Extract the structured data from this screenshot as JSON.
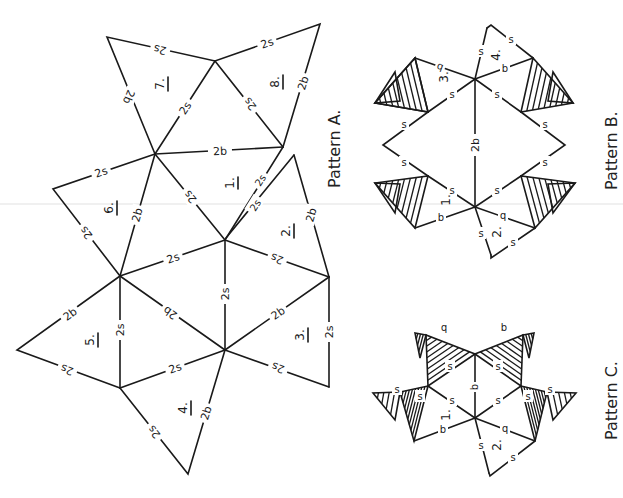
{
  "figure": {
    "patterns": [
      {
        "id": "A",
        "title": "Pattern A.",
        "face_numbers": [
          "1.",
          "2.",
          "3.",
          "4.",
          "5.",
          "6.",
          "7.",
          "8."
        ],
        "edge_labels": {
          "long_side": "2s",
          "base": "2b"
        }
      },
      {
        "id": "B",
        "title": "Pattern B.",
        "face_numbers": [
          "1.",
          "2.",
          "3.",
          "4."
        ],
        "edge_labels": {
          "side": "s",
          "base": "b",
          "center_spine": "2b"
        }
      },
      {
        "id": "C",
        "title": "Pattern C.",
        "face_numbers": [
          "1.",
          "2."
        ],
        "edge_labels": {
          "side": "s",
          "base": "b"
        }
      }
    ]
  },
  "colors": {
    "ink": "#1a1a1a",
    "paper": "#ffffff",
    "fold_line": "#e2e2e2"
  }
}
